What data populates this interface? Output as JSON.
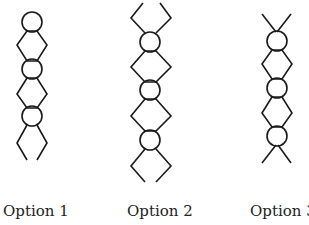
{
  "figure": {
    "stroke_color": "#1a1a1a",
    "background": "#ffffff",
    "options": [
      {
        "label": "Option 1",
        "circles": 3,
        "ends": "top circle, bottom open diamond"
      },
      {
        "label": "Option 2",
        "circles": 3,
        "ends": "open diamond at top and bottom"
      },
      {
        "label": "Option 3",
        "circles": 3,
        "ends": "crossed legs at top and bottom"
      }
    ]
  }
}
